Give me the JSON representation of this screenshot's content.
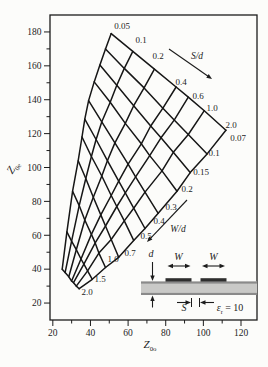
{
  "figure": {
    "background": "#fcfcfa",
    "ink": "#1c1c1c",
    "mesh_color": "#161616"
  },
  "chart_data": {
    "type": "line",
    "title": "",
    "xlabel": {
      "main": "Z",
      "sub": "0o"
    },
    "ylabel": {
      "main": "Z",
      "sub": "0e"
    },
    "xlim": [
      18.5,
      128.5
    ],
    "ylim": [
      10,
      190
    ],
    "grid": false,
    "legend": "none",
    "x_ticks_major": [
      20,
      40,
      60,
      80,
      100,
      120
    ],
    "x_ticks_minor": [
      30,
      50,
      70,
      90,
      110
    ],
    "y_ticks_major": [
      20,
      40,
      60,
      80,
      100,
      120,
      140,
      160,
      180
    ],
    "y_ticks_minor": [
      30,
      50,
      70,
      90,
      110,
      130,
      150,
      170
    ],
    "parameter_families": {
      "sd": {
        "label": "S/d",
        "values": [
          0.05,
          0.1,
          0.2,
          0.4,
          0.6,
          1.0,
          2.0
        ]
      },
      "wd": {
        "label": "W/d",
        "values": [
          0.07,
          0.1,
          0.15,
          0.2,
          0.3,
          0.4,
          0.5,
          0.7,
          1.0,
          1.5,
          2.0
        ]
      }
    },
    "series": [
      {
        "name": "S/d = 0.05",
        "sd": 0.05,
        "x": [
          51,
          48,
          45,
          42,
          39,
          37,
          35.5,
          33.5,
          30.5,
          27.5,
          25
        ],
        "y": [
          179,
          170,
          160.5,
          150.5,
          139.5,
          128.5,
          118,
          104,
          86,
          62,
          40
        ]
      },
      {
        "name": "S/d = 0.1",
        "sd": 0.1,
        "x": [
          62.5,
          58,
          54,
          50.5,
          46,
          43,
          40.5,
          37.5,
          34,
          30,
          26.5
        ],
        "y": [
          168.5,
          158.5,
          148.5,
          138.5,
          127,
          116.5,
          106.5,
          93.5,
          77.5,
          56.5,
          38
        ]
      },
      {
        "name": "S/d = 0.2",
        "sd": 0.2,
        "x": [
          74,
          68.5,
          63,
          58.5,
          53,
          49,
          46,
          41.5,
          37,
          32.5,
          28.5
        ],
        "y": [
          158,
          147,
          136.5,
          126,
          114.5,
          104,
          95,
          82.5,
          69,
          51.5,
          35.5
        ]
      },
      {
        "name": "S/d = 0.4",
        "sd": 0.4,
        "x": [
          85.5,
          78.5,
          72,
          67,
          60,
          55,
          51,
          45.5,
          40.5,
          35,
          30
        ],
        "y": [
          147.5,
          135,
          124.5,
          114,
          102,
          92,
          83.5,
          72,
          60.5,
          46,
          33
        ]
      },
      {
        "name": "S/d = 0.6",
        "sd": 0.6,
        "x": [
          92,
          84.5,
          77.5,
          71.5,
          64,
          58.5,
          54,
          48,
          42.5,
          36.5,
          31
        ],
        "y": [
          141.5,
          128,
          117.5,
          107,
          94.5,
          85,
          77,
          65.5,
          55.5,
          43,
          32
        ]
      },
      {
        "name": "S/d = 1.0",
        "sd": 1.0,
        "x": [
          100.5,
          92,
          84,
          78,
          69,
          63,
          58,
          51,
          44.5,
          38.5,
          32.5
        ],
        "y": [
          133.5,
          119.5,
          109,
          98,
          85.5,
          76,
          68.5,
          57.5,
          49.5,
          39,
          30
        ]
      },
      {
        "name": "S/d = 2.0",
        "sd": 2.0,
        "x": [
          112,
          102,
          93,
          86,
          76,
          69,
          63,
          55,
          48,
          41,
          34
        ],
        "y": [
          122,
          108,
          97,
          86,
          73,
          64,
          57,
          47,
          41,
          34,
          28.5
        ]
      }
    ],
    "curve_labels": {
      "sd": [
        {
          "text": "0.05",
          "x": 122,
          "y": 26
        },
        {
          "text": "0.1",
          "x": 141,
          "y": 40
        },
        {
          "text": "0.2",
          "x": 158,
          "y": 56
        },
        {
          "text": "0.4",
          "x": 181,
          "y": 82
        },
        {
          "text": "0.6",
          "x": 198,
          "y": 96
        },
        {
          "text": "1.0",
          "x": 212,
          "y": 108
        },
        {
          "text": "2.0",
          "x": 231,
          "y": 125
        }
      ],
      "wd": [
        {
          "text": "0.07",
          "x": 238,
          "y": 138
        },
        {
          "text": "0.1",
          "x": 214,
          "y": 153
        },
        {
          "text": "0.15",
          "x": 201,
          "y": 172
        },
        {
          "text": "0.2",
          "x": 187,
          "y": 189
        },
        {
          "text": "0.3",
          "x": 171,
          "y": 207
        },
        {
          "text": "0.4",
          "x": 159,
          "y": 221
        },
        {
          "text": "0.5",
          "x": 146,
          "y": 236
        },
        {
          "text": "0.7",
          "x": 130,
          "y": 253
        },
        {
          "text": "1.0",
          "x": 113,
          "y": 259
        },
        {
          "text": "1.5",
          "x": 100,
          "y": 279
        },
        {
          "text": "2.0",
          "x": 87,
          "y": 292
        }
      ]
    },
    "arrows": [
      {
        "label": "S/d",
        "x1": 169,
        "y1": 49,
        "x2": 212,
        "y2": 79,
        "tx": 197,
        "ty": 56
      },
      {
        "label": "W/d",
        "x1": 187,
        "y1": 200,
        "x2": 147,
        "y2": 242,
        "tx": 178,
        "ty": 229
      }
    ]
  },
  "inset": {
    "d": "d",
    "w1": "W",
    "w2": "W",
    "s": "S",
    "er": {
      "sym": "ε",
      "sub": "r",
      "rest": " = 10"
    }
  }
}
